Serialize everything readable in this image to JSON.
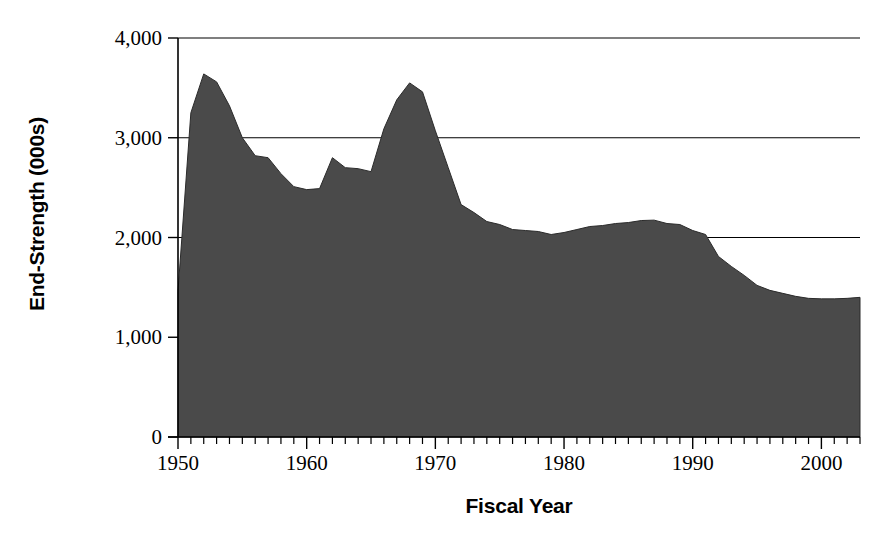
{
  "chart_data": {
    "type": "area",
    "title": "",
    "xlabel": "Fiscal Year",
    "ylabel": "End-Strength (000s)",
    "xlim": [
      1950,
      2003
    ],
    "ylim": [
      0,
      4000
    ],
    "grid": true,
    "legend": "none",
    "series_name": "End-Strength",
    "fill_color": "#4a4a4a",
    "y_ticks": [
      0,
      1000,
      2000,
      3000,
      4000
    ],
    "y_tick_labels": [
      "0",
      "1,000",
      "2,000",
      "3,000",
      "4,000"
    ],
    "x_ticks": [
      1950,
      1960,
      1970,
      1980,
      1990,
      2000
    ],
    "x_tick_labels": [
      "1950",
      "1960",
      "1970",
      "1980",
      "1990",
      "2000"
    ],
    "x_minor_tick_interval": 1,
    "x": [
      1950,
      1951,
      1952,
      1953,
      1954,
      1955,
      1956,
      1957,
      1958,
      1959,
      1960,
      1961,
      1962,
      1963,
      1964,
      1965,
      1966,
      1967,
      1968,
      1969,
      1970,
      1971,
      1972,
      1973,
      1974,
      1975,
      1976,
      1977,
      1978,
      1979,
      1980,
      1981,
      1982,
      1983,
      1984,
      1985,
      1986,
      1987,
      1988,
      1989,
      1990,
      1991,
      1992,
      1993,
      1994,
      1995,
      1996,
      1997,
      1998,
      1999,
      2000,
      2001,
      2002,
      2003
    ],
    "values": [
      1460,
      3250,
      3640,
      3560,
      3320,
      3000,
      2820,
      2800,
      2640,
      2510,
      2480,
      2490,
      2800,
      2700,
      2690,
      2660,
      3090,
      3380,
      3550,
      3460,
      3070,
      2700,
      2330,
      2250,
      2160,
      2130,
      2080,
      2070,
      2060,
      2030,
      2050,
      2080,
      2110,
      2120,
      2140,
      2150,
      2170,
      2174,
      2140,
      2130,
      2070,
      2030,
      1810,
      1710,
      1620,
      1520,
      1470,
      1440,
      1410,
      1390,
      1385,
      1385,
      1390,
      1400
    ]
  },
  "axes": {
    "y_title": "End-Strength (000s)",
    "x_title": "Fiscal Year"
  }
}
